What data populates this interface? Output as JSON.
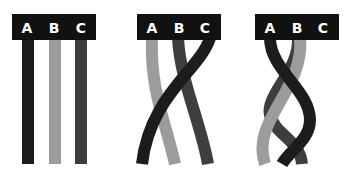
{
  "figure": {
    "colors": {
      "A": "#1c1c1c",
      "B": "#9c9c9c",
      "C": "#3e3e3e",
      "header": "#111111",
      "label": "#ffffff"
    },
    "panels": [
      {
        "id": "step-1",
        "labels": [
          "A",
          "B",
          "C"
        ],
        "state": "straight"
      },
      {
        "id": "step-2",
        "labels": [
          "A",
          "B",
          "C"
        ],
        "state": "one crossing"
      },
      {
        "id": "step-3",
        "labels": [
          "A",
          "B",
          "C"
        ],
        "state": "braided"
      }
    ]
  }
}
